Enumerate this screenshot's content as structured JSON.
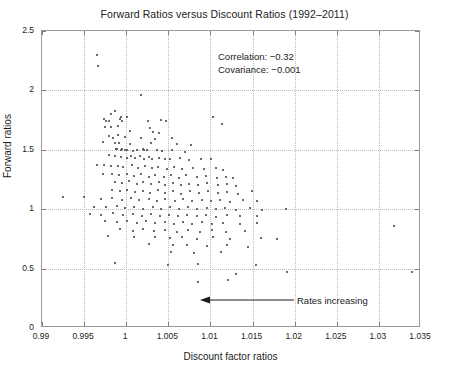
{
  "chart_data": {
    "type": "scatter",
    "title": "Forward Ratios versus Discount Ratios (1992–2011)",
    "xlabel": "Discount factor ratios",
    "ylabel": "Forward ratios",
    "xlim": [
      0.99,
      1.035
    ],
    "ylim": [
      0,
      2.5
    ],
    "xticks": [
      0.99,
      0.995,
      1.0,
      1.005,
      1.01,
      1.015,
      1.02,
      1.025,
      1.03,
      1.035
    ],
    "xticklabels": [
      "0.99",
      "0.995",
      "1",
      "1.005",
      "1.01",
      "1.015",
      "1.02",
      "1.025",
      "1.03",
      "1.035"
    ],
    "yticks": [
      0,
      0.5,
      1.0,
      1.5,
      2.0,
      2.5
    ],
    "yticklabels": [
      "0",
      "0.5",
      "1",
      "1.5",
      "2",
      "2.5"
    ],
    "grid": true,
    "legend": null,
    "marker": "dot",
    "marker_color": "#3b3b3b",
    "marker_size": 2,
    "grid_color": "#b9b9b9",
    "axis_color": "#9a9a9a",
    "annotations": [
      {
        "name": "correlation-text",
        "text": "Correlation: −0.32",
        "x": 1.0105,
        "y": 2.18
      },
      {
        "name": "covariance-text",
        "text": "Covariance: −0.001",
        "x": 1.0105,
        "y": 2.07
      },
      {
        "name": "rates-increasing-arrow",
        "text": "Rates increasing",
        "arrow_from_x": 1.0175,
        "arrow_to_x": 1.0112,
        "arrow_y": 0.335,
        "direction": "left"
      }
    ],
    "stats": {
      "correlation": -0.32,
      "covariance": -0.001
    },
    "n_points": 232,
    "points": [
      [
        0.99655,
        2.295
      ],
      [
        0.99665,
        2.205
      ],
      [
        1.00175,
        1.965
      ],
      [
        0.99815,
        1.8
      ],
      [
        0.99865,
        1.825
      ],
      [
        0.99935,
        1.775
      ],
      [
        1.00015,
        1.78
      ],
      [
        0.9974,
        1.76
      ],
      [
        0.99755,
        1.745
      ],
      [
        0.998,
        1.745
      ],
      [
        0.9993,
        1.76
      ],
      [
        0.99945,
        1.745
      ],
      [
        1.00255,
        1.745
      ],
      [
        1.00415,
        1.75
      ],
      [
        1.00475,
        1.745
      ],
      [
        1.01025,
        1.775
      ],
      [
        1.01135,
        1.715
      ],
      [
        0.99745,
        1.69
      ],
      [
        0.99825,
        1.695
      ],
      [
        0.99905,
        1.7
      ],
      [
        1.00045,
        1.66
      ],
      [
        1.00285,
        1.68
      ],
      [
        1.00315,
        1.65
      ],
      [
        1.00395,
        1.645
      ],
      [
        0.9979,
        1.615
      ],
      [
        0.99845,
        1.6
      ],
      [
        0.999,
        1.625
      ],
      [
        0.99985,
        1.605
      ],
      [
        1.0018,
        1.6
      ],
      [
        1.00345,
        1.59
      ],
      [
        1.00545,
        1.6
      ],
      [
        0.9973,
        1.565
      ],
      [
        0.99865,
        1.56
      ],
      [
        0.99915,
        1.555
      ],
      [
        1.0005,
        1.545
      ],
      [
        1.00295,
        1.555
      ],
      [
        1.00605,
        1.545
      ],
      [
        1.00775,
        1.54
      ],
      [
        0.99875,
        1.51
      ],
      [
        0.99895,
        1.505
      ],
      [
        0.99935,
        1.5
      ],
      [
        0.99955,
        1.505
      ],
      [
        0.99985,
        1.495
      ],
      [
        1.00005,
        1.5
      ],
      [
        1.00075,
        1.49
      ],
      [
        1.00125,
        1.5
      ],
      [
        1.00195,
        1.505
      ],
      [
        1.00215,
        1.495
      ],
      [
        1.0025,
        1.5
      ],
      [
        1.00365,
        1.495
      ],
      [
        1.00425,
        1.49
      ],
      [
        1.00545,
        1.5
      ],
      [
        1.00695,
        1.48
      ],
      [
        0.99795,
        1.455
      ],
      [
        0.99865,
        1.45
      ],
      [
        0.99935,
        1.44
      ],
      [
        1.00005,
        1.435
      ],
      [
        1.00055,
        1.45
      ],
      [
        1.00105,
        1.43
      ],
      [
        1.00165,
        1.445
      ],
      [
        1.00215,
        1.425
      ],
      [
        1.00265,
        1.44
      ],
      [
        1.00305,
        1.42
      ],
      [
        1.00395,
        1.435
      ],
      [
        1.00465,
        1.425
      ],
      [
        1.00525,
        1.42
      ],
      [
        1.00635,
        1.435
      ],
      [
        1.00745,
        1.415
      ],
      [
        1.00885,
        1.425
      ],
      [
        1.01005,
        1.42
      ],
      [
        0.99655,
        1.37
      ],
      [
        0.99735,
        1.375
      ],
      [
        0.99815,
        1.36
      ],
      [
        0.99905,
        1.365
      ],
      [
        0.99965,
        1.355
      ],
      [
        1.00065,
        1.37
      ],
      [
        1.00145,
        1.35
      ],
      [
        1.00225,
        1.365
      ],
      [
        1.00305,
        1.345
      ],
      [
        1.00375,
        1.355
      ],
      [
        1.00485,
        1.34
      ],
      [
        1.00565,
        1.355
      ],
      [
        1.00665,
        1.335
      ],
      [
        1.00795,
        1.35
      ],
      [
        1.00925,
        1.34
      ],
      [
        1.01065,
        1.345
      ],
      [
        1.01155,
        1.33
      ],
      [
        0.99725,
        1.3
      ],
      [
        0.99835,
        1.295
      ],
      [
        0.99915,
        1.285
      ],
      [
        1.00015,
        1.3
      ],
      [
        1.00095,
        1.28
      ],
      [
        1.00175,
        1.295
      ],
      [
        1.00265,
        1.275
      ],
      [
        1.00345,
        1.29
      ],
      [
        1.00445,
        1.27
      ],
      [
        1.00535,
        1.285
      ],
      [
        1.00625,
        1.265
      ],
      [
        1.00715,
        1.285
      ],
      [
        1.00835,
        1.27
      ],
      [
        1.00945,
        1.28
      ],
      [
        1.01075,
        1.265
      ],
      [
        1.01185,
        1.275
      ],
      [
        1.01265,
        1.26
      ],
      [
        0.99865,
        1.23
      ],
      [
        0.99945,
        1.22
      ],
      [
        1.00035,
        1.235
      ],
      [
        1.00125,
        1.215
      ],
      [
        1.00205,
        1.23
      ],
      [
        1.00295,
        1.21
      ],
      [
        1.00385,
        1.225
      ],
      [
        1.00465,
        1.205
      ],
      [
        1.00555,
        1.22
      ],
      [
        1.00645,
        1.2
      ],
      [
        1.00745,
        1.215
      ],
      [
        1.00855,
        1.205
      ],
      [
        1.00965,
        1.22
      ],
      [
        1.01085,
        1.2
      ],
      [
        1.01195,
        1.21
      ],
      [
        1.01305,
        1.195
      ],
      [
        0.99835,
        1.16
      ],
      [
        0.99925,
        1.15
      ],
      [
        1.00015,
        1.165
      ],
      [
        1.00105,
        1.145
      ],
      [
        1.00195,
        1.155
      ],
      [
        1.00285,
        1.14
      ],
      [
        1.00375,
        1.16
      ],
      [
        1.00465,
        1.135
      ],
      [
        1.00555,
        1.15
      ],
      [
        1.00655,
        1.13
      ],
      [
        1.00755,
        1.155
      ],
      [
        1.00865,
        1.14
      ],
      [
        1.00975,
        1.15
      ],
      [
        1.01085,
        1.135
      ],
      [
        1.01195,
        1.145
      ],
      [
        1.01325,
        1.13
      ],
      [
        1.01495,
        1.15
      ],
      [
        0.99255,
        1.1
      ],
      [
        0.99495,
        1.105
      ],
      [
        0.99695,
        1.09
      ],
      [
        0.99835,
        1.095
      ],
      [
        0.99945,
        1.08
      ],
      [
        1.00055,
        1.095
      ],
      [
        1.00155,
        1.075
      ],
      [
        1.00265,
        1.09
      ],
      [
        1.00365,
        1.07
      ],
      [
        1.00465,
        1.085
      ],
      [
        1.00575,
        1.065
      ],
      [
        1.00675,
        1.085
      ],
      [
        1.00785,
        1.07
      ],
      [
        1.00895,
        1.08
      ],
      [
        1.01005,
        1.065
      ],
      [
        1.01115,
        1.075
      ],
      [
        1.01235,
        1.06
      ],
      [
        1.01385,
        1.075
      ],
      [
        1.01555,
        1.065
      ],
      [
        0.99615,
        1.02
      ],
      [
        0.99755,
        1.015
      ],
      [
        0.99885,
        1.025
      ],
      [
        0.99985,
        1.01
      ],
      [
        1.00095,
        1.02
      ],
      [
        1.00205,
        1.005
      ],
      [
        1.00315,
        1.02
      ],
      [
        1.00415,
        1.0
      ],
      [
        1.00515,
        1.015
      ],
      [
        1.00625,
        0.998
      ],
      [
        1.00735,
        1.015
      ],
      [
        1.00845,
        1.002
      ],
      [
        1.00955,
        1.012
      ],
      [
        1.01065,
        0.998
      ],
      [
        1.01175,
        1.01
      ],
      [
        1.01305,
        0.995
      ],
      [
        1.01465,
        1.008
      ],
      [
        1.01615,
        0.995
      ],
      [
        1.01895,
        1.005
      ],
      [
        0.99565,
        0.96
      ],
      [
        0.99705,
        0.955
      ],
      [
        0.99845,
        0.965
      ],
      [
        0.99965,
        0.95
      ],
      [
        1.00075,
        0.96
      ],
      [
        1.00185,
        0.945
      ],
      [
        1.00295,
        0.958
      ],
      [
        1.00405,
        0.942
      ],
      [
        1.00505,
        0.955
      ],
      [
        1.00615,
        0.94
      ],
      [
        1.00725,
        0.955
      ],
      [
        1.00835,
        0.945
      ],
      [
        1.00945,
        0.952
      ],
      [
        1.01065,
        0.938
      ],
      [
        1.01195,
        0.95
      ],
      [
        1.01355,
        0.94
      ],
      [
        1.01555,
        0.945
      ],
      [
        1.03185,
        0.86
      ],
      [
        0.99745,
        0.9
      ],
      [
        0.99885,
        0.89
      ],
      [
        1.00015,
        0.9
      ],
      [
        1.00125,
        0.885
      ],
      [
        1.00235,
        0.898
      ],
      [
        1.00345,
        0.88
      ],
      [
        1.00455,
        0.895
      ],
      [
        1.00565,
        0.878
      ],
      [
        1.00675,
        0.892
      ],
      [
        1.00785,
        0.875
      ],
      [
        1.00895,
        0.89
      ],
      [
        1.01015,
        0.878
      ],
      [
        1.01155,
        0.885
      ],
      [
        1.01345,
        0.875
      ],
      [
        1.01555,
        0.885
      ],
      [
        0.99925,
        0.83
      ],
      [
        1.00075,
        0.82
      ],
      [
        1.00205,
        0.835
      ],
      [
        1.00335,
        0.815
      ],
      [
        1.00465,
        0.828
      ],
      [
        1.00605,
        0.81
      ],
      [
        1.00735,
        0.825
      ],
      [
        1.00875,
        0.812
      ],
      [
        1.01015,
        0.822
      ],
      [
        1.01185,
        0.808
      ],
      [
        1.01405,
        0.82
      ],
      [
        0.99785,
        0.775
      ],
      [
        1.00095,
        0.765
      ],
      [
        1.00345,
        0.77
      ],
      [
        1.00515,
        0.755
      ],
      [
        1.00665,
        0.765
      ],
      [
        1.00845,
        0.748
      ],
      [
        1.01025,
        0.762
      ],
      [
        1.01235,
        0.75
      ],
      [
        1.01605,
        0.755
      ],
      [
        1.01795,
        0.745
      ],
      [
        1.00265,
        0.705
      ],
      [
        1.00555,
        0.695
      ],
      [
        1.00725,
        0.7
      ],
      [
        1.00965,
        0.69
      ],
      [
        1.01195,
        0.7
      ],
      [
        1.01445,
        0.685
      ],
      [
        1.00535,
        0.64
      ],
      [
        1.00805,
        0.63
      ],
      [
        1.01125,
        0.64
      ],
      [
        0.99865,
        0.545
      ],
      [
        1.00495,
        0.53
      ],
      [
        1.00855,
        0.54
      ],
      [
        1.01545,
        0.53
      ],
      [
        1.01305,
        0.455
      ],
      [
        1.01905,
        0.47
      ],
      [
        1.03395,
        0.47
      ],
      [
        1.00855,
        0.385
      ],
      [
        1.01205,
        0.405
      ]
    ]
  }
}
